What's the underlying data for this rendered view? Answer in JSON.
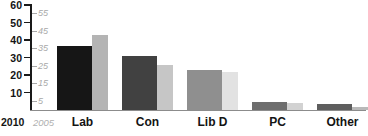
{
  "chart_data": {
    "type": "bar",
    "title": "",
    "subtitle": "",
    "xlabel": "",
    "ylabel": "",
    "grid": false,
    "legend_position": "origin",
    "categories": [
      "Lab",
      "Con",
      "Lib D",
      "PC",
      "Other"
    ],
    "series": [
      {
        "name": "2010",
        "color": "#1c1c1c",
        "values": [
          36.5,
          31,
          23,
          4.5,
          3.5
        ]
      },
      {
        "name": "2005",
        "color": "#c9c9c9",
        "values": [
          43,
          26,
          21.5,
          4,
          1.7
        ]
      }
    ],
    "bar_colors_2010": [
      "#161616",
      "#414141",
      "#8f8f8f",
      "#6e6e6e",
      "#5e5e5e"
    ],
    "bar_colors_2005": [
      "#b4b4b4",
      "#c6c6c6",
      "#e2e2e2",
      "#d2d2d2",
      "#b9b9b9"
    ],
    "ylim": [
      0,
      60
    ],
    "axis_2010": {
      "label": "2010",
      "ticks": [
        10,
        20,
        30,
        40,
        50,
        60
      ],
      "tick_labels": [
        "10",
        "20",
        "30",
        "40",
        "50",
        "60"
      ]
    },
    "axis_2005": {
      "label": "2005",
      "ticks": [
        5,
        15,
        25,
        35,
        45,
        55
      ],
      "tick_labels": [
        "5",
        "15",
        "25",
        "35",
        "45",
        "55"
      ]
    }
  }
}
